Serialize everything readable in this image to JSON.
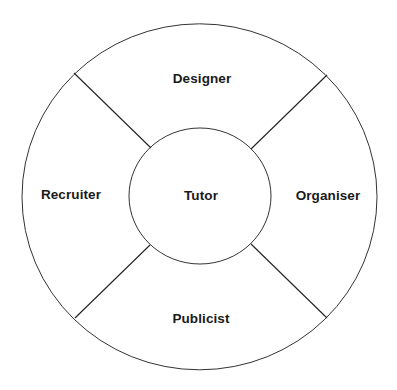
{
  "diagram": {
    "type": "ring-segmented-circle",
    "center": {
      "label": "Tutor"
    },
    "segments": [
      {
        "position": "top",
        "label": "Designer"
      },
      {
        "position": "right",
        "label": "Organiser"
      },
      {
        "position": "bottom",
        "label": "Publicist"
      },
      {
        "position": "left",
        "label": "Recruiter"
      }
    ],
    "colors": {
      "background": "#ffffff",
      "stroke": "#2a2a2a",
      "text": "#1a1a1a"
    }
  }
}
